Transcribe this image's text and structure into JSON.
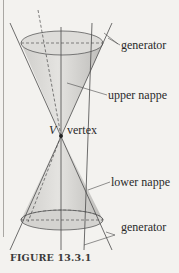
{
  "figure": {
    "caption": "FIGURE 13.3.1",
    "labels": {
      "generator_top": "generator",
      "upper_nappe": "upper nappe",
      "vertex_symbol": "V",
      "vertex": "vertex",
      "lower_nappe": "lower nappe",
      "generator_bottom": "generator"
    },
    "colors": {
      "background": "#f3f2ef",
      "cone_fill": "#d9d8d5",
      "cone_shade": "#c4c3c0",
      "line": "#4a4a4a",
      "text": "#2a2a2a"
    }
  }
}
